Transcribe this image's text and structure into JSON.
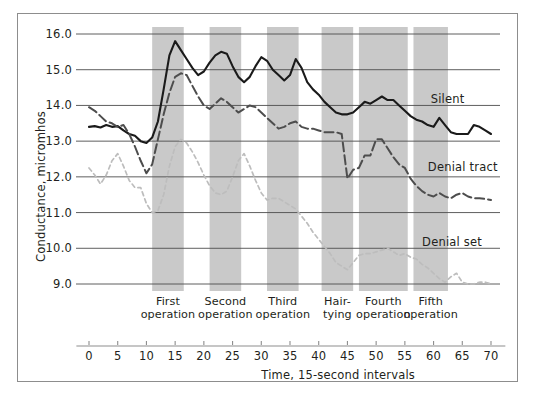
{
  "chart_data": {
    "type": "line",
    "title": "",
    "xlabel": "Time, 15-second intervals",
    "ylabel": "Conductance, micromhos",
    "xlim": [
      -2,
      72
    ],
    "ylim": [
      8.5,
      16.3
    ],
    "xticks": [
      0,
      5,
      10,
      15,
      20,
      25,
      30,
      35,
      40,
      45,
      50,
      55,
      60,
      65,
      70
    ],
    "yticks": [
      "9.0",
      "10.0",
      "11.0",
      "12.0",
      "13.0",
      "14.0",
      "15.0",
      "16.0"
    ],
    "grid": "horizontal",
    "legend_position": "inline-right",
    "colors": {
      "silent": "#1a1a1a",
      "denial_tract": "#4d4d4d",
      "denial_set": "#bdbdbd",
      "band": "#c9c9c9",
      "grid": "#4d4d4d",
      "frame": "#8d8d8d"
    },
    "bands": [
      {
        "label_line1": "First",
        "label_line2": "operation",
        "x0": 11.0,
        "x1": 16.5
      },
      {
        "label_line1": "Second",
        "label_line2": "operation",
        "x0": 21.0,
        "x1": 26.5
      },
      {
        "label_line1": "Third",
        "label_line2": "operation",
        "x0": 31.0,
        "x1": 36.5
      },
      {
        "label_line1": "Hair-",
        "label_line2": "tying",
        "x0": 40.5,
        "x1": 46.0
      },
      {
        "label_line1": "Fourth",
        "label_line2": "operation",
        "x0": 47.0,
        "x1": 55.5
      },
      {
        "label_line1": "Fifth",
        "label_line2": "operation",
        "x0": 56.5,
        "x1": 62.5
      }
    ],
    "series": [
      {
        "name": "Silent",
        "style": "solid",
        "label_x": 59.5,
        "label_y": 14.15,
        "x": [
          0,
          1,
          2,
          3,
          4,
          5,
          6,
          7,
          8,
          9,
          10,
          11,
          12,
          13,
          14,
          15,
          16,
          17,
          18,
          19,
          20,
          21,
          22,
          23,
          24,
          25,
          26,
          27,
          28,
          29,
          30,
          31,
          32,
          33,
          34,
          35,
          36,
          37,
          38,
          39,
          40,
          41,
          42,
          43,
          44,
          45,
          46,
          47,
          48,
          49,
          50,
          51,
          52,
          53,
          54,
          55,
          56,
          57,
          58,
          59,
          60,
          61,
          62,
          63,
          64,
          65,
          66,
          67,
          68,
          69,
          70
        ],
        "y": [
          13.4,
          13.42,
          13.38,
          13.45,
          13.4,
          13.42,
          13.3,
          13.2,
          13.15,
          13.0,
          12.95,
          13.1,
          13.55,
          14.45,
          15.4,
          15.8,
          15.55,
          15.3,
          15.05,
          14.85,
          14.95,
          15.2,
          15.4,
          15.5,
          15.45,
          15.1,
          14.8,
          14.65,
          14.8,
          15.1,
          15.35,
          15.25,
          15.0,
          14.85,
          14.7,
          14.85,
          15.3,
          15.05,
          14.65,
          14.45,
          14.3,
          14.1,
          13.95,
          13.8,
          13.75,
          13.75,
          13.8,
          13.95,
          14.1,
          14.05,
          14.15,
          14.25,
          14.15,
          14.15,
          14.0,
          13.85,
          13.7,
          13.6,
          13.55,
          13.45,
          13.4,
          13.65,
          13.45,
          13.25,
          13.2,
          13.2,
          13.2,
          13.45,
          13.4,
          13.3,
          13.2
        ]
      },
      {
        "name": "Denial tract",
        "style": "dashed",
        "label_x": 59.0,
        "label_y": 12.25,
        "x": [
          0,
          1,
          2,
          3,
          4,
          5,
          6,
          7,
          8,
          9,
          10,
          11,
          12,
          13,
          14,
          15,
          16,
          17,
          18,
          19,
          20,
          21,
          22,
          23,
          24,
          25,
          26,
          27,
          28,
          29,
          30,
          31,
          32,
          33,
          34,
          35,
          36,
          37,
          38,
          39,
          40,
          41,
          42,
          43,
          44,
          45,
          46,
          47,
          48,
          49,
          50,
          51,
          52,
          53,
          54,
          55,
          56,
          57,
          58,
          59,
          60,
          61,
          62,
          63,
          64,
          65,
          66,
          67,
          68,
          69,
          70
        ],
        "y": [
          13.95,
          13.85,
          13.7,
          13.55,
          13.5,
          13.4,
          13.45,
          13.2,
          12.85,
          12.45,
          12.1,
          12.35,
          13.05,
          13.75,
          14.35,
          14.8,
          14.9,
          14.85,
          14.55,
          14.25,
          14.0,
          13.9,
          14.05,
          14.2,
          14.1,
          13.95,
          13.8,
          13.9,
          14.0,
          13.95,
          13.8,
          13.65,
          13.5,
          13.35,
          13.4,
          13.5,
          13.55,
          13.4,
          13.35,
          13.35,
          13.3,
          13.25,
          13.25,
          13.25,
          13.2,
          11.95,
          12.2,
          12.25,
          12.6,
          12.6,
          13.05,
          13.05,
          12.8,
          12.55,
          12.35,
          12.25,
          11.95,
          11.75,
          11.6,
          11.5,
          11.45,
          11.55,
          11.45,
          11.4,
          11.5,
          11.55,
          11.45,
          11.4,
          11.4,
          11.38,
          11.35
        ]
      },
      {
        "name": "Denial set",
        "style": "dotted",
        "label_x": 58.0,
        "label_y": 10.15,
        "x": [
          0,
          1,
          2,
          3,
          4,
          5,
          6,
          7,
          8,
          9,
          10,
          11,
          12,
          13,
          14,
          15,
          16,
          17,
          18,
          19,
          20,
          21,
          22,
          23,
          24,
          25,
          26,
          27,
          28,
          29,
          30,
          31,
          32,
          33,
          34,
          35,
          36,
          37,
          38,
          39,
          40,
          41,
          42,
          43,
          44,
          45,
          46,
          47,
          48,
          49,
          50,
          51,
          52,
          53,
          54,
          55,
          56,
          57,
          58,
          59,
          60,
          61,
          62,
          63,
          64,
          65,
          66,
          67,
          68,
          69,
          70
        ],
        "y": [
          12.25,
          12.05,
          11.8,
          12.05,
          12.45,
          12.65,
          12.3,
          11.9,
          11.7,
          11.7,
          11.25,
          11.0,
          11.05,
          11.5,
          12.3,
          12.85,
          13.05,
          12.95,
          12.7,
          12.4,
          12.05,
          11.75,
          11.55,
          11.5,
          11.6,
          12.0,
          12.45,
          12.65,
          12.3,
          11.9,
          11.55,
          11.35,
          11.4,
          11.4,
          11.3,
          11.2,
          11.1,
          10.9,
          10.7,
          10.45,
          10.25,
          10.05,
          9.85,
          9.6,
          9.5,
          9.4,
          9.6,
          9.8,
          9.85,
          9.85,
          9.9,
          9.95,
          10.0,
          9.9,
          9.8,
          9.85,
          9.75,
          9.7,
          9.55,
          9.45,
          9.3,
          9.15,
          9.05,
          9.2,
          9.3,
          9.05,
          9.0,
          9.0,
          9.05,
          9.05,
          9.0
        ]
      }
    ]
  }
}
